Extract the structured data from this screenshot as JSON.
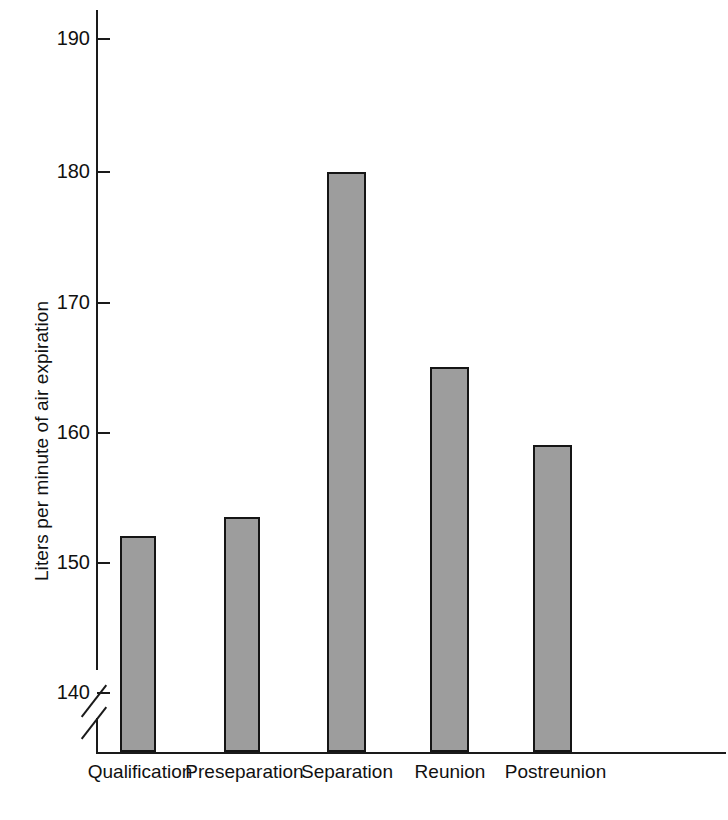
{
  "chart_data": {
    "type": "bar",
    "title": "",
    "subtitle": "",
    "xlabel": "",
    "ylabel": "Liters per minute of air expiration",
    "categories": [
      "Qualification",
      "Preseparation",
      "Separation",
      "Reunion",
      "Postreunion"
    ],
    "values": [
      152,
      153.5,
      180,
      165,
      159
    ],
    "ylim": [
      140,
      190
    ],
    "y_ticks": [
      140,
      150,
      160,
      170,
      180,
      190
    ],
    "y_tick_labels": [
      "140",
      "150",
      "160",
      "170",
      "180",
      "190"
    ],
    "axis_break": true,
    "axis_break_note": "y-axis broken below 140",
    "grid": false,
    "legend": null,
    "bar_fill_color": "#9d9d9d",
    "bar_edge_color": "#151515",
    "background_color": "#ffffff"
  },
  "axis": {
    "y_title": "Liters per minute of air expiration"
  }
}
